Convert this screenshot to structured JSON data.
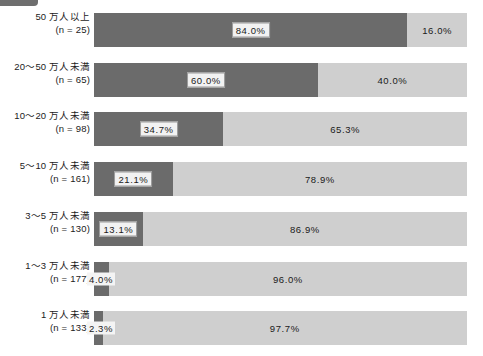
{
  "corner_tag": {
    "name": "cropped-tag-fragment",
    "color": "#6e6e6e"
  },
  "colors": {
    "dark_segment": "#6b6b6b",
    "light_segment": "#cfcfcf",
    "background": "#ffffff",
    "text": "#1a1a1a",
    "label_box_fill": "#f2f2f2",
    "label_box_border": "#9a9a9a"
  },
  "chart_data": {
    "type": "bar",
    "orientation": "horizontal",
    "stacked": true,
    "normalized": true,
    "title": "",
    "xlabel": "",
    "ylabel": "",
    "xlim": [
      0,
      100
    ],
    "grid": false,
    "legend": "none",
    "categories": [
      "50 万人以上",
      "20〜50 万人未満",
      "10〜20 万人未満",
      "5〜10 万人未満",
      "3〜5 万人未満",
      "1〜3 万人未満",
      "1 万人未満"
    ],
    "category_sublabels": [
      "(n = 25)",
      "(n = 65)",
      "(n = 98)",
      "(n = 161)",
      "(n = 130)",
      "(n = 177)",
      "(n = 133)"
    ],
    "n_values": [
      25,
      65,
      98,
      161,
      130,
      177,
      133
    ],
    "series": [
      {
        "name": "dark",
        "color": "#6b6b6b",
        "values": [
          84.0,
          60.0,
          34.7,
          21.1,
          13.1,
          4.0,
          2.3
        ],
        "labels": [
          "84.0%",
          "60.0%",
          "34.7%",
          "21.1%",
          "13.1%",
          "4.0%",
          "2.3%"
        ]
      },
      {
        "name": "light",
        "color": "#cfcfcf",
        "values": [
          16.0,
          40.0,
          65.3,
          78.9,
          86.9,
          96.0,
          97.7
        ],
        "labels": [
          "16.0%",
          "40.0%",
          "65.3%",
          "78.9%",
          "86.9%",
          "96.0%",
          "97.7%"
        ]
      }
    ]
  },
  "rows": [
    {
      "label": "50 万人以上",
      "sublabel": "(n = 25)",
      "dark": 84.0,
      "light": 16.0,
      "dark_label": "84.0%",
      "light_label": "16.0%"
    },
    {
      "label": "20〜50 万人未満",
      "sublabel": "(n = 65)",
      "dark": 60.0,
      "light": 40.0,
      "dark_label": "60.0%",
      "light_label": "40.0%"
    },
    {
      "label": "10〜20 万人未満",
      "sublabel": "(n = 98)",
      "dark": 34.7,
      "light": 65.3,
      "dark_label": "34.7%",
      "light_label": "65.3%"
    },
    {
      "label": "5〜10 万人未満",
      "sublabel": "(n = 161)",
      "dark": 21.1,
      "light": 78.9,
      "dark_label": "21.1%",
      "light_label": "78.9%"
    },
    {
      "label": "3〜5 万人未満",
      "sublabel": "(n = 130)",
      "dark": 13.1,
      "light": 86.9,
      "dark_label": "13.1%",
      "light_label": "86.9%"
    },
    {
      "label": "1〜3 万人未満",
      "sublabel": "(n = 177)",
      "dark": 4.0,
      "light": 96.0,
      "dark_label": "4.0%",
      "light_label": "96.0%"
    },
    {
      "label": "1 万人未満",
      "sublabel": "(n = 133)",
      "dark": 2.3,
      "light": 97.7,
      "dark_label": "2.3%",
      "light_label": "97.7%"
    }
  ]
}
